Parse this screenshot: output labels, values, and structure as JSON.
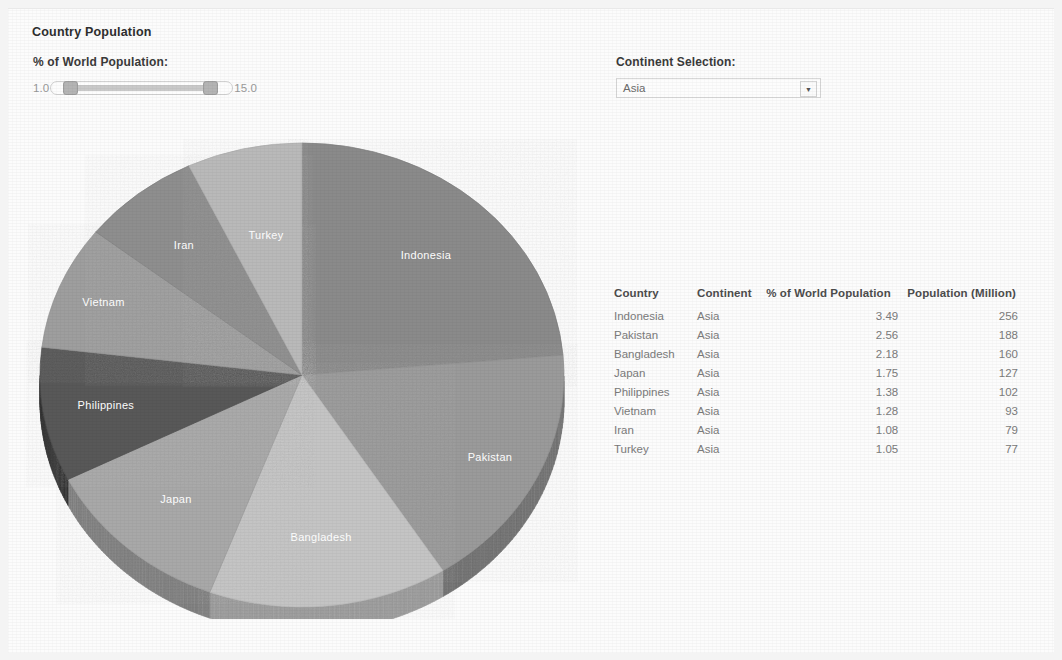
{
  "page": {
    "title": "Country Population",
    "background_color": "#f4f4f4",
    "card_color": "#fcfcfc"
  },
  "controls": {
    "slider": {
      "label": "% of World Population:",
      "min_label": "1.0",
      "max_label": "15.0",
      "min_value": 1.0,
      "max_value": 15.0,
      "selected_min": 1.0,
      "selected_max": 11.5
    },
    "continent": {
      "label": "Continent Selection:",
      "selected": "Asia",
      "arrow_icon": "chevron-down-icon",
      "options": [
        "Asia"
      ]
    }
  },
  "chart_data": {
    "type": "pie",
    "title": "Country Population",
    "value_field": "% of World Population",
    "start_angle_deg": 0,
    "direction": "clockwise",
    "legend": "slice-labels",
    "labels": [
      "Indonesia",
      "Pakistan",
      "Bangladesh",
      "Japan",
      "Philippines",
      "Vietnam",
      "Iran",
      "Turkey"
    ],
    "values": [
      3.49,
      2.56,
      2.18,
      1.75,
      1.38,
      1.28,
      1.08,
      1.05
    ],
    "total": 14.77,
    "colors": [
      "#8a8a8a",
      "#9a9a9a",
      "#c4c4c4",
      "#a8a8a8",
      "#595959",
      "#9e9e9e",
      "#8e8e8e",
      "#b9b9b9"
    ],
    "slices": [
      {
        "label": "Indonesia",
        "value": 3.49,
        "percent_of_total": 23.6,
        "color": "#8a8a8a"
      },
      {
        "label": "Pakistan",
        "value": 2.56,
        "percent_of_total": 17.3,
        "color": "#9a9a9a"
      },
      {
        "label": "Bangladesh",
        "value": 2.18,
        "percent_of_total": 14.8,
        "color": "#c4c4c4"
      },
      {
        "label": "Japan",
        "value": 1.75,
        "percent_of_total": 11.8,
        "color": "#a8a8a8"
      },
      {
        "label": "Philippines",
        "value": 1.38,
        "percent_of_total": 9.3,
        "color": "#595959"
      },
      {
        "label": "Vietnam",
        "value": 1.28,
        "percent_of_total": 8.7,
        "color": "#9e9e9e"
      },
      {
        "label": "Iran",
        "value": 1.08,
        "percent_of_total": 7.3,
        "color": "#8e8e8e"
      },
      {
        "label": "Turkey",
        "value": 1.05,
        "percent_of_total": 7.1,
        "color": "#b9b9b9"
      }
    ]
  },
  "table": {
    "headers": [
      "Country",
      "Continent",
      "% of World Population",
      "Population (Million)"
    ],
    "rows": [
      {
        "country": "Indonesia",
        "continent": "Asia",
        "pct": "3.49",
        "population": "256"
      },
      {
        "country": "Pakistan",
        "continent": "Asia",
        "pct": "2.56",
        "population": "188"
      },
      {
        "country": "Bangladesh",
        "continent": "Asia",
        "pct": "2.18",
        "population": "160"
      },
      {
        "country": "Japan",
        "continent": "Asia",
        "pct": "1.75",
        "population": "127"
      },
      {
        "country": "Philippines",
        "continent": "Asia",
        "pct": "1.38",
        "population": "102"
      },
      {
        "country": "Vietnam",
        "continent": "Asia",
        "pct": "1.28",
        "population": "93"
      },
      {
        "country": "Iran",
        "continent": "Asia",
        "pct": "1.08",
        "population": "79"
      },
      {
        "country": "Turkey",
        "continent": "Asia",
        "pct": "1.05",
        "population": "77"
      }
    ]
  }
}
